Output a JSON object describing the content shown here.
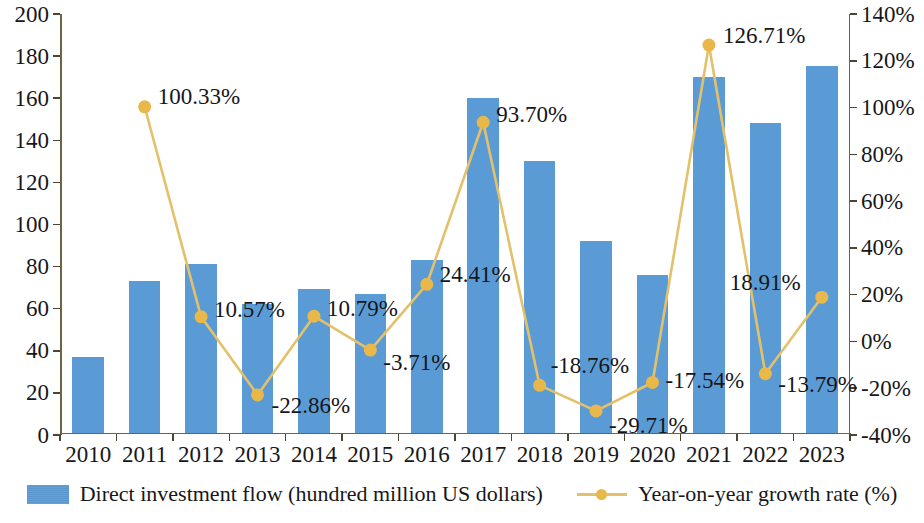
{
  "chart_data": {
    "type": "bar",
    "title": "",
    "xlabel": "",
    "ylabel": "",
    "grid": false,
    "legend_position": "bottom",
    "categories": [
      "2010",
      "2011",
      "2012",
      "2013",
      "2014",
      "2015",
      "2016",
      "2017",
      "2018",
      "2019",
      "2020",
      "2021",
      "2022",
      "2023"
    ],
    "series": [
      {
        "name": "Direct investment flow (hundred million US dollars)",
        "type": "bar",
        "axis": "left",
        "color": "#5b9bd5",
        "values": [
          36,
          72,
          80,
          61,
          68,
          66,
          82,
          159,
          129,
          91,
          75,
          169,
          147,
          174
        ]
      },
      {
        "name": "Year-on-year growth rate (%)",
        "type": "line",
        "axis": "right",
        "color": "#e8b84b",
        "values": [
          null,
          100.33,
          10.57,
          -22.86,
          10.79,
          -3.71,
          24.41,
          93.7,
          -18.76,
          -29.71,
          -17.54,
          126.71,
          -13.79,
          18.91
        ],
        "labels": [
          "",
          "100.33%",
          "10.57%",
          "-22.86%",
          "10.79%",
          "-3.71%",
          "24.41%",
          "93.70%",
          "-18.76%",
          "-29.71%",
          "-17.54%",
          "126.71%",
          "-13.79%",
          "18.91%"
        ]
      }
    ],
    "y_left": {
      "min": 0,
      "max": 200,
      "step": 20,
      "ticks": [
        "0",
        "20",
        "40",
        "60",
        "80",
        "100",
        "120",
        "140",
        "160",
        "180",
        "200"
      ]
    },
    "y_right": {
      "min": -40,
      "max": 140,
      "step": 20,
      "ticks": [
        "-40%",
        "-20%",
        "0%",
        "20%",
        "40%",
        "60%",
        "80%",
        "100%",
        "120%",
        "140%"
      ]
    }
  },
  "legend": {
    "items": [
      {
        "label": "Direct investment flow (hundred million US dollars)",
        "marker": "bar-swatch"
      },
      {
        "label": "Year-on-year growth rate (%)",
        "marker": "line-marker-swatch"
      }
    ]
  }
}
